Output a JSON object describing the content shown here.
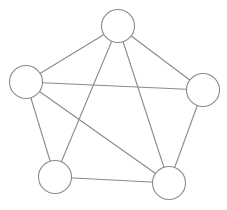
{
  "diagram": {
    "type": "graph",
    "width": 227,
    "height": 210,
    "colors": {
      "background": "#ffffff",
      "stroke": "#8a8a8a",
      "node_fill": "#ffffff"
    },
    "node_radius": 16.5,
    "nodes": [
      {
        "id": "top",
        "x": 118,
        "y": 26
      },
      {
        "id": "left",
        "x": 26,
        "y": 82
      },
      {
        "id": "right",
        "x": 203,
        "y": 90
      },
      {
        "id": "bottom-left",
        "x": 55,
        "y": 177
      },
      {
        "id": "bottom-right",
        "x": 169,
        "y": 183
      }
    ],
    "edges": [
      {
        "from": "top",
        "to": "left"
      },
      {
        "from": "top",
        "to": "right"
      },
      {
        "from": "top",
        "to": "bottom-left"
      },
      {
        "from": "top",
        "to": "bottom-right"
      },
      {
        "from": "left",
        "to": "right"
      },
      {
        "from": "left",
        "to": "bottom-left"
      },
      {
        "from": "left",
        "to": "bottom-right"
      },
      {
        "from": "right",
        "to": "bottom-right"
      },
      {
        "from": "bottom-left",
        "to": "bottom-right"
      }
    ]
  }
}
